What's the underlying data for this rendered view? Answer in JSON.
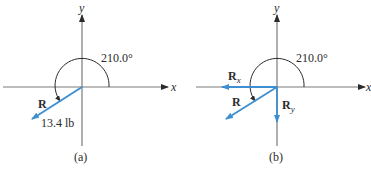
{
  "panels": [
    {
      "id": "a",
      "caption": "(a)",
      "axis_x_label": "x",
      "axis_y_label": "y",
      "angle_label": "210.0°",
      "vector_label": "R",
      "magnitude_label": "13.4 lb"
    },
    {
      "id": "b",
      "caption": "(b)",
      "axis_x_label": "x",
      "axis_y_label": "y",
      "angle_label": "210.0°",
      "vector_label": "R",
      "component_x_label": "R",
      "component_x_sub": "x",
      "component_y_label": "R",
      "component_y_sub": "y"
    }
  ],
  "colors": {
    "axis": "#7a7a7a",
    "vector": "#3d8fd1",
    "arc": "#2b2b2b",
    "text": "#2b2b2b"
  }
}
